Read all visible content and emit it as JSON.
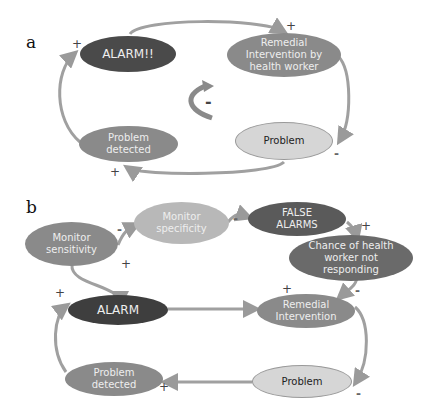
{
  "colors": {
    "arrow": "#9a9a9a",
    "alarm": "#4a4a4a",
    "mid": "#8a8a8a",
    "light": "#d6d6d6",
    "dark_text": "#222222",
    "light_text": "#e8e8e8"
  },
  "panel_a": {
    "label": "a",
    "nodes": {
      "alarm": "ALARM!!",
      "remedial": "Remedial\nIntervention by\nhealth worker",
      "problem": "Problem",
      "detected": "Problem\ndetected"
    },
    "signs": {
      "alarm": "+",
      "remedial": "+",
      "problem": "-",
      "detected": "+",
      "loop": "-"
    }
  },
  "panel_b": {
    "label": "b",
    "nodes": {
      "sensitivity": "Monitor\nsensitivity",
      "specificity": "Monitor\nspecificity",
      "false_alarms": "FALSE\nALARMS",
      "chance": "Chance of health\nworker  not\nresponding",
      "alarm": "ALARM",
      "remedial": "Remedial\nIntervention",
      "problem": "Problem",
      "detected": "Problem\ndetected"
    },
    "signs": {
      "specificity": "-",
      "sensitivity_to_alarm": "+",
      "false_alarms": "-",
      "chance": "+",
      "remedial_plus": "+",
      "remedial_minus": "-",
      "alarm": "+",
      "problem": "-",
      "detected": "+"
    }
  }
}
